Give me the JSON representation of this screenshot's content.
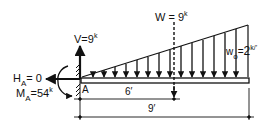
{
  "diagram": {
    "type": "cantilever-beam-free-body",
    "support": {
      "label": "A"
    },
    "reactions": {
      "vertical": {
        "symbol": "V",
        "eq": "=",
        "value": "9",
        "unit": "k"
      },
      "horizontal": {
        "symbol": "H",
        "sub": "A",
        "eq": "= 0"
      },
      "moment": {
        "symbol": "M",
        "sub": "A",
        "eq": "=",
        "value": "54",
        "unit": "k"
      }
    },
    "load": {
      "type": "triangular-distributed",
      "intensity": {
        "symbol": "w",
        "sub": "o",
        "eq": "=",
        "value": "2",
        "unit": "k/’"
      },
      "resultant": {
        "symbol": "W",
        "eq": " = ",
        "value": "9",
        "unit": "k"
      }
    },
    "dimensions": [
      {
        "label": "6′"
      },
      {
        "label": "9′"
      }
    ]
  }
}
